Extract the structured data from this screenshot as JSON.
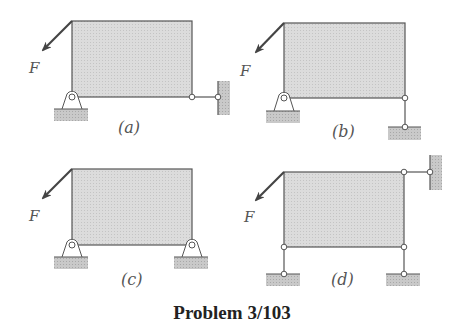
{
  "title": "Problem 3/103",
  "force_label": "F",
  "panels": [
    {
      "id": "a",
      "label": "(a)",
      "supports": [
        "pin support at lower-left",
        "two-force link at lower-right to vertical wall"
      ]
    },
    {
      "id": "b",
      "label": "(b)",
      "supports": [
        "pin support at lower-left",
        "vertical two-force link at lower-right to ground"
      ]
    },
    {
      "id": "c",
      "label": "(c)",
      "supports": [
        "pin support at lower-left",
        "pin support at lower-right"
      ]
    },
    {
      "id": "d",
      "label": "(d)",
      "supports": [
        "vertical link at lower-left to ground",
        "vertical link at lower-right to ground",
        "horizontal link at upper-right to vertical wall"
      ]
    }
  ],
  "colors": {
    "frame_fill": "#d8d8d8",
    "line": "#555555",
    "ground": "#bdbdbd",
    "arrow": "#444444"
  }
}
